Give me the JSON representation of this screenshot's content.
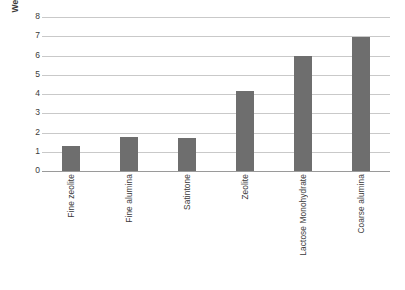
{
  "chart_data": {
    "type": "bar",
    "title": "",
    "xlabel": "",
    "ylabel": "Weighted Euclidean Distance",
    "categories": [
      "Fine zeolite",
      "Fine alumina",
      "Satintone",
      "Zeolite",
      "Lactose Monohydrate",
      "Coarse alumina"
    ],
    "values": [
      1.3,
      1.75,
      1.73,
      4.15,
      5.95,
      6.95
    ],
    "ylim": [
      0,
      8
    ],
    "ytick_labels": [
      "8",
      "7",
      "6",
      "5",
      "4",
      "3",
      "2",
      "1",
      "0"
    ],
    "ytick_values": [
      8,
      7,
      6,
      5,
      4,
      3,
      2,
      1,
      0
    ],
    "ytick_step": 1,
    "grid": true,
    "legend": false,
    "bar_color": "#6e6e6e",
    "gridline_color": "#c9c9c9",
    "axis_color": "#9a9a9a",
    "background_color": "#ffffff"
  }
}
